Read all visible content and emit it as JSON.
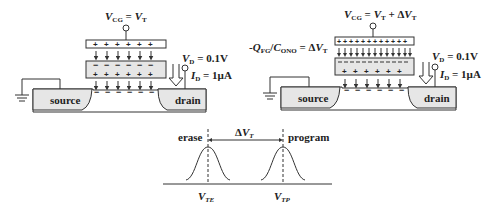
{
  "left_cell": {
    "gate_label": {
      "v": "V",
      "sub": "CG",
      "eq": " = ",
      "v2": "V",
      "sub2": "T"
    },
    "drain_voltage": {
      "v": "V",
      "sub": "D",
      "rest": " = 0.1V"
    },
    "drain_current": {
      "v": "I",
      "sub": "D",
      "rest": " = 1µA"
    },
    "source_label": "source",
    "drain_label": "drain",
    "control_gate_charges": "+",
    "floating_gate_top_charges": "−",
    "floating_gate_bottom_charges": "+",
    "channel_charges": "−"
  },
  "right_cell": {
    "gate_label": {
      "v": "V",
      "sub": "CG",
      "eq": " = ",
      "v2": "V",
      "sub2": "T",
      "plus": " + Δ",
      "v3": "V",
      "sub3": "T"
    },
    "stored_charge_label": {
      "prefix": "-",
      "q": "Q",
      "qsub": "FG",
      "slash": "/",
      "c": "C",
      "csub": "ONO",
      "eq": " = Δ",
      "v": "V",
      "vsub": "T"
    },
    "drain_voltage": {
      "v": "V",
      "sub": "D",
      "rest": " = 0.1V"
    },
    "drain_current": {
      "v": "I",
      "sub": "D",
      "rest": " = 1µA"
    },
    "source_label": "source",
    "drain_label": "drain"
  },
  "distribution_plot": {
    "erase_label": "erase",
    "program_label": "program",
    "delta_label": {
      "d": "Δ",
      "v": "V",
      "sub": "T"
    },
    "vte_label": {
      "v": "V",
      "sub": "TE"
    },
    "vtp_label": {
      "v": "V",
      "sub": "TP"
    }
  },
  "colors": {
    "stroke": "#333333",
    "fill_gray": "#e6e6e6",
    "background": "#ffffff"
  }
}
